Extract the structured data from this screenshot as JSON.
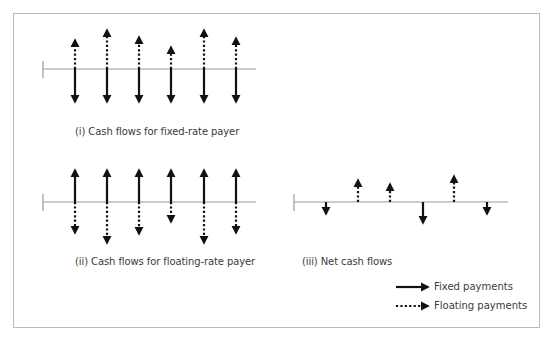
{
  "panels": [
    {
      "id": "fixed",
      "caption": "(i) Cash flows for fixed-rate payer",
      "axis": {
        "x1": 43,
        "x2": 256,
        "y": 69
      },
      "arrows": [
        {
          "x": 75,
          "up": {
            "type": "floating",
            "to": 40
          },
          "down": {
            "type": "fixed",
            "to": 102
          }
        },
        {
          "x": 107,
          "up": {
            "type": "floating",
            "to": 30
          },
          "down": {
            "type": "fixed",
            "to": 102
          }
        },
        {
          "x": 139,
          "up": {
            "type": "floating",
            "to": 37
          },
          "down": {
            "type": "fixed",
            "to": 102
          }
        },
        {
          "x": 171,
          "up": {
            "type": "floating",
            "to": 47
          },
          "down": {
            "type": "fixed",
            "to": 102
          }
        },
        {
          "x": 204,
          "up": {
            "type": "floating",
            "to": 30
          },
          "down": {
            "type": "fixed",
            "to": 102
          }
        },
        {
          "x": 236,
          "up": {
            "type": "floating",
            "to": 38
          },
          "down": {
            "type": "fixed",
            "to": 102
          }
        }
      ]
    },
    {
      "id": "floating",
      "caption": "(ii) Cash flows for floating-rate payer",
      "axis": {
        "x1": 43,
        "x2": 256,
        "y": 202
      },
      "arrows": [
        {
          "x": 75,
          "up": {
            "type": "fixed",
            "to": 170
          },
          "down": {
            "type": "floating",
            "to": 233
          }
        },
        {
          "x": 107,
          "up": {
            "type": "fixed",
            "to": 170
          },
          "down": {
            "type": "floating",
            "to": 243
          }
        },
        {
          "x": 139,
          "up": {
            "type": "fixed",
            "to": 170
          },
          "down": {
            "type": "floating",
            "to": 234
          }
        },
        {
          "x": 171,
          "up": {
            "type": "fixed",
            "to": 170
          },
          "down": {
            "type": "floating",
            "to": 222
          }
        },
        {
          "x": 204,
          "up": {
            "type": "fixed",
            "to": 170
          },
          "down": {
            "type": "floating",
            "to": 243
          }
        },
        {
          "x": 236,
          "up": {
            "type": "fixed",
            "to": 170
          },
          "down": {
            "type": "floating",
            "to": 233
          }
        }
      ]
    },
    {
      "id": "net",
      "caption": "(iii) Net cash flows",
      "axis": {
        "x1": 294,
        "x2": 508,
        "y": 202
      },
      "arrows": [
        {
          "x": 326,
          "down": {
            "type": "fixed",
            "to": 214
          }
        },
        {
          "x": 358,
          "up": {
            "type": "floating",
            "to": 180
          }
        },
        {
          "x": 390,
          "up": {
            "type": "floating",
            "to": 184
          }
        },
        {
          "x": 423,
          "down": {
            "type": "fixed",
            "to": 223
          }
        },
        {
          "x": 454,
          "up": {
            "type": "floating",
            "to": 176
          }
        },
        {
          "x": 487,
          "down": {
            "type": "fixed",
            "to": 214
          }
        }
      ]
    }
  ],
  "legend": {
    "fixed_label": "Fixed payments",
    "floating_label": "Floating payments"
  },
  "colors": {
    "arrow": "#111111",
    "axis": "#9a9a9a",
    "border": "#b9b9b9",
    "text": "#3a3a3a"
  }
}
